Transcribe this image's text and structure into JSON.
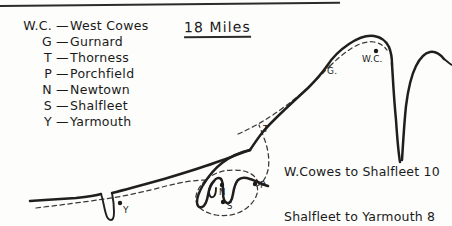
{
  "page": {
    "title": "18 Miles",
    "style_note": "hand-drawn map of the north-west coast of the Isle of Wight"
  },
  "legend": {
    "rows": [
      {
        "abbr": "W.C.",
        "dash": "—",
        "name": "West Cowes"
      },
      {
        "abbr": "G",
        "dash": "—",
        "name": "Gurnard"
      },
      {
        "abbr": "T",
        "dash": "—",
        "name": "Thorness"
      },
      {
        "abbr": "P",
        "dash": "—",
        "name": "Porchfield"
      },
      {
        "abbr": "N",
        "dash": "—",
        "name": "Newtown"
      },
      {
        "abbr": "S",
        "dash": "—",
        "name": "Shalfleet"
      },
      {
        "abbr": "Y",
        "dash": "—",
        "name": "Yarmouth"
      }
    ]
  },
  "distances": {
    "line1": "W.Cowes to Shalfleet 10",
    "line2": "Shalfleet to Yarmouth 8"
  },
  "map": {
    "place_markers": [
      {
        "id": "west-cowes",
        "label": "W.C.",
        "x": 376,
        "y": 56
      },
      {
        "id": "gurnard",
        "label": "G.",
        "x": 333,
        "y": 70
      },
      {
        "id": "thorness",
        "label": "T",
        "x": 266,
        "y": 129
      },
      {
        "id": "porchfield",
        "label": "P",
        "x": 262,
        "y": 183
      },
      {
        "id": "newtown",
        "label": "N",
        "x": 225,
        "y": 190
      },
      {
        "id": "shalfleet",
        "label": "S",
        "x": 229,
        "y": 205
      },
      {
        "id": "yarmouth",
        "label": "Y",
        "x": 88,
        "y": 206
      }
    ],
    "colors": {
      "ink": "#201f1d",
      "route": "#3a3936",
      "paper": "#fdfdfb"
    }
  }
}
